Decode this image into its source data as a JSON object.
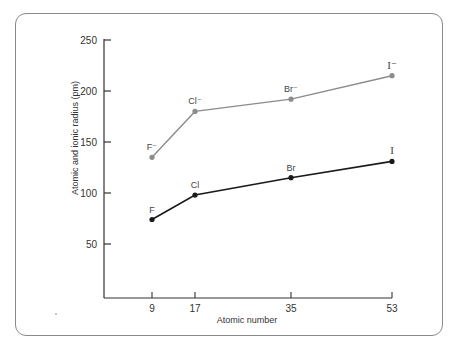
{
  "chart_data": {
    "type": "line",
    "title": "",
    "xlabel": "Atomic number",
    "ylabel": "Atomic and ionic radius (pm)",
    "x": [
      9,
      17,
      35,
      53
    ],
    "x_tick_labels": [
      "9",
      "17",
      "35",
      "53"
    ],
    "y_ticks": [
      50,
      100,
      150,
      200,
      250
    ],
    "y_tick_labels": [
      "50",
      "100",
      "150",
      "200",
      "250"
    ],
    "ylim": [
      0,
      250
    ],
    "grid": false,
    "legend": null,
    "series": [
      {
        "name": "Ionic radius (X⁻)",
        "color": "#8c8c8c",
        "values": [
          135,
          180,
          192,
          215
        ],
        "point_labels": [
          "F⁻",
          "Cl⁻",
          "Br⁻",
          "I⁻"
        ]
      },
      {
        "name": "Atomic radius (X)",
        "color": "#1a1a1a",
        "values": [
          74,
          98,
          115,
          131
        ],
        "point_labels": [
          "F",
          "Cl",
          "Br",
          "I"
        ]
      }
    ]
  }
}
